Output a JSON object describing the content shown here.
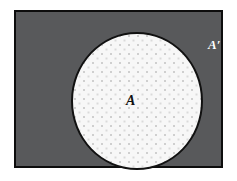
{
  "diagram": {
    "type": "venn-set-diagram",
    "universal_set": {
      "label": "",
      "region_name": "universe-rectangle",
      "fill_color": "#58595b",
      "border_color": "#0d0d0d"
    },
    "set_a": {
      "label": "A",
      "region_name": "set-a-circle",
      "fill_color": "#f7f7f7",
      "border_color": "#111111",
      "pattern": "dotted"
    },
    "complement": {
      "label": "A′",
      "region_name": "complement-region",
      "fill_color": "#58595b",
      "text_color": "#ffffff"
    },
    "background_color": "#ffffff"
  }
}
